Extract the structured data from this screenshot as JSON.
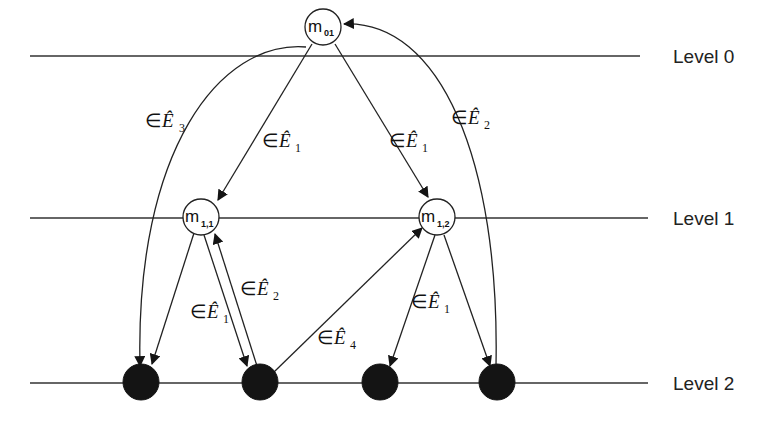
{
  "diagram": {
    "type": "hierarchical graph",
    "levels": [
      {
        "id": "level-0",
        "label": "Level 0",
        "y": 56
      },
      {
        "id": "level-1",
        "label": "Level 1",
        "y": 218
      },
      {
        "id": "level-2",
        "label": "Level 2",
        "y": 383
      }
    ],
    "nodes": [
      {
        "id": "m01",
        "label": "m",
        "sub": "01",
        "level": 0,
        "style": "open"
      },
      {
        "id": "m11",
        "label": "m",
        "sub": "1,1",
        "level": 1,
        "style": "open"
      },
      {
        "id": "m12",
        "label": "m",
        "sub": "1,2",
        "level": 1,
        "style": "open"
      },
      {
        "id": "n1",
        "label": "",
        "level": 2,
        "style": "filled"
      },
      {
        "id": "n2",
        "label": "",
        "level": 2,
        "style": "filled"
      },
      {
        "id": "n3",
        "label": "",
        "level": 2,
        "style": "filled"
      },
      {
        "id": "n4",
        "label": "",
        "level": 2,
        "style": "filled"
      }
    ],
    "edges": [
      {
        "from": "m01",
        "to": "m11",
        "label": "∈Ê1",
        "prefix": "∈",
        "symbol": "Ê",
        "sub": "1"
      },
      {
        "from": "m01",
        "to": "m12",
        "label": "∈Ê1",
        "prefix": "∈",
        "symbol": "Ê",
        "sub": "1"
      },
      {
        "from": "m01",
        "to": "n1",
        "label": "∈Ê3",
        "prefix": "∈",
        "symbol": "Ê",
        "sub": "3"
      },
      {
        "from": "n4",
        "to": "m01",
        "label": "∈Ê2",
        "prefix": "∈",
        "symbol": "Ê",
        "sub": "2"
      },
      {
        "from": "m11",
        "to": "n1",
        "label": "",
        "prefix": "",
        "symbol": "",
        "sub": ""
      },
      {
        "from": "m11",
        "to": "n2",
        "label": "∈Ê1",
        "prefix": "∈",
        "symbol": "Ê",
        "sub": "1"
      },
      {
        "from": "n2",
        "to": "m11",
        "label": "∈Ê2",
        "prefix": "∈",
        "symbol": "Ê",
        "sub": "2"
      },
      {
        "from": "n2",
        "to": "m12",
        "label": "∈Ê4",
        "prefix": "∈",
        "symbol": "Ê",
        "sub": "4"
      },
      {
        "from": "m12",
        "to": "n3",
        "label": "∈Ê1",
        "prefix": "∈",
        "symbol": "Ê",
        "sub": "1"
      },
      {
        "from": "m12",
        "to": "n4",
        "label": "",
        "prefix": "",
        "symbol": "",
        "sub": ""
      }
    ]
  }
}
